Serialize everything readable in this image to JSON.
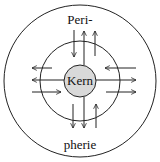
{
  "diagram": {
    "labels": {
      "top": "Peri-",
      "bottom": "pherie",
      "core": "Kern"
    },
    "colors": {
      "stroke": "#222222",
      "core_fill": "#d9d9d9",
      "background": "#ffffff"
    },
    "circles": [
      {
        "name": "periphery-outer",
        "cx": 80,
        "cy": 81,
        "r": 76
      },
      {
        "name": "middle-ring",
        "cx": 80,
        "cy": 81,
        "r": 40
      },
      {
        "name": "core",
        "cx": 80,
        "cy": 81,
        "r": 16
      }
    ],
    "arrows": [
      {
        "name": "top-inward",
        "x1": 74,
        "y1": 30,
        "x2": 74,
        "y2": 57
      },
      {
        "name": "top-outward-1",
        "x1": 84,
        "y1": 65,
        "x2": 84,
        "y2": 31
      },
      {
        "name": "top-outward-2",
        "x1": 95,
        "y1": 56,
        "x2": 95,
        "y2": 31
      },
      {
        "name": "left-outward-1",
        "x1": 52,
        "y1": 68,
        "x2": 32,
        "y2": 68
      },
      {
        "name": "left-outward-2",
        "x1": 64,
        "y1": 80,
        "x2": 32,
        "y2": 80
      },
      {
        "name": "left-inward",
        "x1": 32,
        "y1": 92,
        "x2": 61,
        "y2": 92
      },
      {
        "name": "right-inward",
        "x1": 136,
        "y1": 68,
        "x2": 105,
        "y2": 68
      },
      {
        "name": "right-outward-1",
        "x1": 96,
        "y1": 80,
        "x2": 136,
        "y2": 80
      },
      {
        "name": "right-outward-2",
        "x1": 106,
        "y1": 92,
        "x2": 136,
        "y2": 92
      },
      {
        "name": "bottom-outward-1",
        "x1": 73,
        "y1": 104,
        "x2": 73,
        "y2": 128
      },
      {
        "name": "bottom-outward-2",
        "x1": 84,
        "y1": 97,
        "x2": 84,
        "y2": 128
      },
      {
        "name": "bottom-inward",
        "x1": 96,
        "y1": 128,
        "x2": 96,
        "y2": 104
      }
    ]
  }
}
